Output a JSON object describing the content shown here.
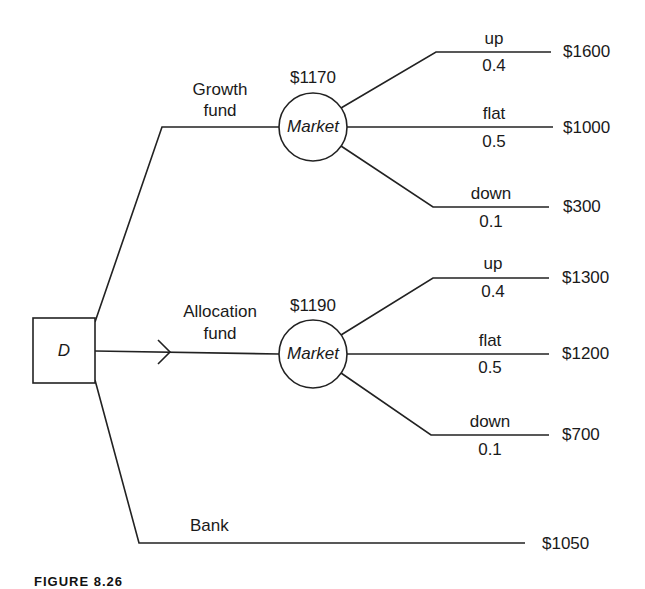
{
  "diagram": {
    "type": "decision-tree",
    "decision_node": {
      "label": "D"
    },
    "branches": [
      {
        "name": "Growth fund",
        "label_line1": "Growth",
        "label_line2": "fund",
        "chance_node": {
          "label": "Market",
          "expected_value": "$1170"
        },
        "outcomes": [
          {
            "state": "up",
            "probability": "0.4",
            "payoff": "$1600"
          },
          {
            "state": "flat",
            "probability": "0.5",
            "payoff": "$1000"
          },
          {
            "state": "down",
            "probability": "0.1",
            "payoff": "$300"
          }
        ]
      },
      {
        "name": "Allocation fund",
        "label_line1": "Allocation",
        "label_line2": "fund",
        "selected": true,
        "chance_node": {
          "label": "Market",
          "expected_value": "$1190"
        },
        "outcomes": [
          {
            "state": "up",
            "probability": "0.4",
            "payoff": "$1300"
          },
          {
            "state": "flat",
            "probability": "0.5",
            "payoff": "$1200"
          },
          {
            "state": "down",
            "probability": "0.1",
            "payoff": "$700"
          }
        ]
      },
      {
        "name": "Bank",
        "label_line1": "Bank",
        "payoff": "$1050"
      }
    ],
    "caption": "FIGURE 8.26"
  },
  "colors": {
    "line": "#222222",
    "text": "#1a1a1a",
    "background": "#ffffff"
  }
}
